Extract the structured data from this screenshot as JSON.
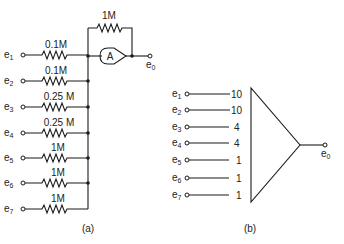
{
  "diagram_a": {
    "caption": "(a)",
    "amplifier_label": "A",
    "feedback_resistor": "1M",
    "output": {
      "name": "e",
      "sub": "0"
    },
    "inputs": [
      {
        "name": "e",
        "sub": "1",
        "resistor": "0.1M"
      },
      {
        "name": "e",
        "sub": "2",
        "resistor": "0.1M"
      },
      {
        "name": "e",
        "sub": "3",
        "resistor": "0.25 M"
      },
      {
        "name": "e",
        "sub": "4",
        "resistor": "0.25 M"
      },
      {
        "name": "e",
        "sub": "5",
        "resistor": "1M"
      },
      {
        "name": "e",
        "sub": "6",
        "resistor": "1M"
      },
      {
        "name": "e",
        "sub": "7",
        "resistor": "1M"
      }
    ]
  },
  "diagram_b": {
    "caption": "(b)",
    "output": {
      "name": "e",
      "sub": "0"
    },
    "inputs": [
      {
        "name": "e",
        "sub": "1",
        "gain": "10"
      },
      {
        "name": "e",
        "sub": "2",
        "gain": "10"
      },
      {
        "name": "e",
        "sub": "3",
        "gain": "4"
      },
      {
        "name": "e",
        "sub": "4",
        "gain": "4"
      },
      {
        "name": "e",
        "sub": "5",
        "gain": "1"
      },
      {
        "name": "e",
        "sub": "6",
        "gain": "1"
      },
      {
        "name": "e",
        "sub": "7",
        "gain": "1"
      }
    ]
  }
}
